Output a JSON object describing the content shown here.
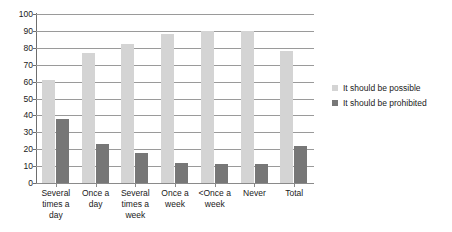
{
  "chart_data": {
    "type": "bar",
    "title": "",
    "subtitle": "",
    "xlabel": "",
    "ylabel": "",
    "ylim": [
      0,
      100
    ],
    "ytick_step": 10,
    "yticks": [
      100,
      90,
      80,
      70,
      60,
      50,
      40,
      30,
      20,
      10,
      0
    ],
    "grid": true,
    "legend_position": "right",
    "categories": [
      "Several times a day",
      "Once a day",
      "Several times a week",
      "Once a week",
      "<Once a week",
      "Never",
      "Total"
    ],
    "category_lines": [
      [
        "Several",
        "times a",
        "day"
      ],
      [
        "Once a",
        "day"
      ],
      [
        "Several",
        "times a",
        "week"
      ],
      [
        "Once a",
        "week"
      ],
      [
        "<Once a",
        "week"
      ],
      [
        "Never"
      ],
      [
        "Total"
      ]
    ],
    "series": [
      {
        "name": "It should be possible",
        "color": "#d4d4d4",
        "values": [
          61,
          77,
          82,
          88,
          90,
          90,
          78
        ]
      },
      {
        "name": "It should be prohibited",
        "color": "#777777",
        "values": [
          38,
          23,
          18,
          12,
          11,
          11,
          22
        ]
      }
    ]
  },
  "legend": {
    "items": [
      {
        "label": "It should be possible"
      },
      {
        "label": "It should be prohibited"
      }
    ]
  },
  "colors": {
    "possible": "#d4d4d4",
    "prohibited": "#777777",
    "gridline": "#9a9a9a",
    "axis": "#6e6e6e",
    "text": "#1a1a1a",
    "background": "#ffffff"
  }
}
